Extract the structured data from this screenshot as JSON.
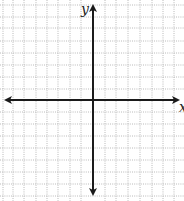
{
  "diagram": {
    "type": "coordinate-plane",
    "labels": {
      "x_axis": "x",
      "y_axis": "y"
    },
    "grid": {
      "spacing_px": 11.6,
      "line_style": "dotted",
      "line_color": "#9a9a9a"
    },
    "axes": {
      "color": "#1a1a1a",
      "arrows": "both-ends"
    }
  }
}
